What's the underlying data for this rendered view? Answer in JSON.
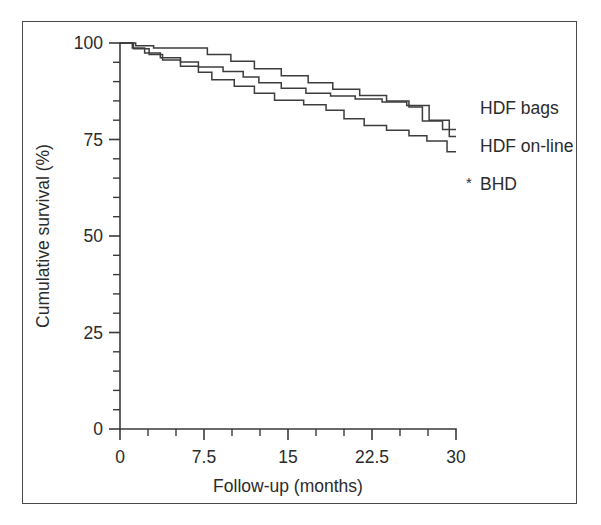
{
  "chart_data": {
    "type": "line",
    "title": "",
    "subtitle": "",
    "xlabel": "Follow-up (months)",
    "ylabel": "Cumulative survival (%)",
    "xlim": [
      0,
      30
    ],
    "ylim": [
      0,
      100
    ],
    "grid": false,
    "legend_position": "right",
    "x_ticks": [
      0,
      7.5,
      15,
      22.5,
      30
    ],
    "x_tick_labels": [
      "0",
      "7.5",
      "15",
      "22.5",
      "30"
    ],
    "x_minor_tick_step": 2.5,
    "y_ticks": [
      0,
      25,
      50,
      75,
      100
    ],
    "y_tick_labels": [
      "0",
      "25",
      "50",
      "75",
      "100"
    ],
    "y_minor_tick_step": 5,
    "series": [
      {
        "name": "HDF bags",
        "legend_marker": "",
        "step": "post",
        "points": [
          [
            0.0,
            100.0
          ],
          [
            1.0,
            100.0
          ],
          [
            1.4,
            99.3
          ],
          [
            2.6,
            99.3
          ],
          [
            3.0,
            98.7
          ],
          [
            7.4,
            98.7
          ],
          [
            7.8,
            97.0
          ],
          [
            9.5,
            97.0
          ],
          [
            9.9,
            95.3
          ],
          [
            11.6,
            95.3
          ],
          [
            12.0,
            93.3
          ],
          [
            14.0,
            93.3
          ],
          [
            14.4,
            91.5
          ],
          [
            16.4,
            91.5
          ],
          [
            16.8,
            89.7
          ],
          [
            18.6,
            89.7
          ],
          [
            19.0,
            88.0
          ],
          [
            21.0,
            88.0
          ],
          [
            21.4,
            86.4
          ],
          [
            23.4,
            86.4
          ],
          [
            23.8,
            85.0
          ],
          [
            25.4,
            85.0
          ],
          [
            25.8,
            83.4
          ],
          [
            26.6,
            83.4
          ],
          [
            27.0,
            79.8
          ],
          [
            28.4,
            79.8
          ],
          [
            28.8,
            77.6
          ],
          [
            30.0,
            77.6
          ]
        ]
      },
      {
        "name": "HDF on-line",
        "legend_marker": "",
        "step": "post",
        "points": [
          [
            0.0,
            100.0
          ],
          [
            0.7,
            100.0
          ],
          [
            1.1,
            98.7
          ],
          [
            1.8,
            98.7
          ],
          [
            2.2,
            97.4
          ],
          [
            3.2,
            97.4
          ],
          [
            3.6,
            96.2
          ],
          [
            5.0,
            96.2
          ],
          [
            5.4,
            95.1
          ],
          [
            6.6,
            95.1
          ],
          [
            7.0,
            93.8
          ],
          [
            8.8,
            93.8
          ],
          [
            9.2,
            92.6
          ],
          [
            10.6,
            92.6
          ],
          [
            11.0,
            91.2
          ],
          [
            12.0,
            91.2
          ],
          [
            12.4,
            89.7
          ],
          [
            14.0,
            89.7
          ],
          [
            14.4,
            88.3
          ],
          [
            16.2,
            88.3
          ],
          [
            16.6,
            87.0
          ],
          [
            18.4,
            87.0
          ],
          [
            18.8,
            86.3
          ],
          [
            20.6,
            86.3
          ],
          [
            21.0,
            85.5
          ],
          [
            23.0,
            85.5
          ],
          [
            23.4,
            84.7
          ],
          [
            25.2,
            84.7
          ],
          [
            25.6,
            83.8
          ],
          [
            27.2,
            83.8
          ],
          [
            27.6,
            80.0
          ],
          [
            29.0,
            80.0
          ],
          [
            29.4,
            75.8
          ],
          [
            30.0,
            75.8
          ]
        ]
      },
      {
        "name": "BHD",
        "legend_marker": "*",
        "step": "post",
        "points": [
          [
            0.0,
            100.0
          ],
          [
            0.8,
            100.0
          ],
          [
            1.2,
            98.5
          ],
          [
            2.2,
            98.5
          ],
          [
            2.6,
            97.0
          ],
          [
            3.4,
            97.0
          ],
          [
            3.8,
            95.6
          ],
          [
            5.0,
            95.6
          ],
          [
            5.4,
            94.0
          ],
          [
            6.6,
            94.0
          ],
          [
            7.0,
            92.4
          ],
          [
            7.8,
            92.4
          ],
          [
            8.2,
            90.5
          ],
          [
            9.8,
            90.5
          ],
          [
            10.2,
            88.8
          ],
          [
            11.6,
            88.8
          ],
          [
            12.0,
            87.0
          ],
          [
            13.4,
            87.0
          ],
          [
            13.8,
            85.2
          ],
          [
            16.0,
            85.2
          ],
          [
            16.4,
            84.0
          ],
          [
            18.0,
            84.0
          ],
          [
            18.4,
            82.6
          ],
          [
            19.6,
            82.6
          ],
          [
            20.0,
            80.4
          ],
          [
            21.4,
            80.4
          ],
          [
            21.8,
            78.6
          ],
          [
            23.4,
            78.6
          ],
          [
            23.8,
            77.4
          ],
          [
            25.4,
            77.4
          ],
          [
            25.8,
            76.0
          ],
          [
            27.0,
            76.0
          ],
          [
            27.4,
            74.6
          ],
          [
            28.8,
            74.6
          ],
          [
            29.2,
            71.8
          ],
          [
            30.0,
            71.8
          ]
        ]
      }
    ]
  },
  "legend": {
    "entries": [
      {
        "label": "HDF bags",
        "marker": ""
      },
      {
        "label": "HDF on-line",
        "marker": ""
      },
      {
        "label": "BHD",
        "marker": "*"
      }
    ]
  },
  "colors": {
    "line": "#3d3d3d",
    "axis": "#3a3a3a",
    "text": "#2b2b2b",
    "frame": "#4a4a4a",
    "background": "#ffffff"
  }
}
